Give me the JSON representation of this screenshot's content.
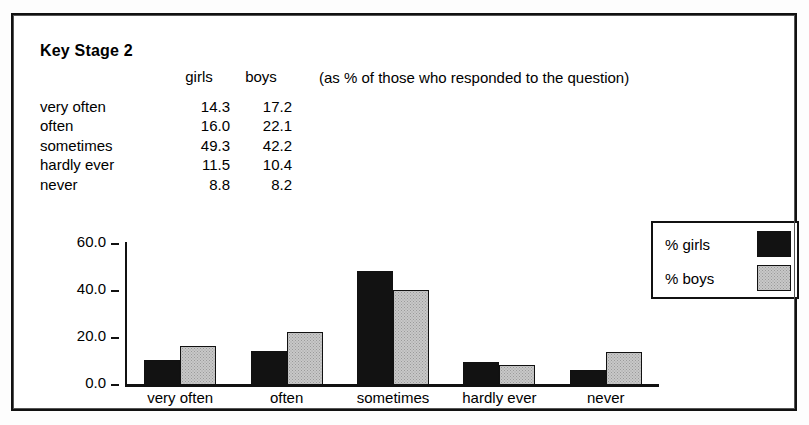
{
  "header": {
    "title": "Key Stage 2",
    "note": "(as % of those who responded to the question)"
  },
  "table": {
    "col_headers": [
      "girls",
      "boys"
    ],
    "rows": [
      {
        "label": "very often",
        "girls": "14.3",
        "boys": "17.2"
      },
      {
        "label": "often",
        "girls": "16.0",
        "boys": "22.1"
      },
      {
        "label": "sometimes",
        "girls": "49.3",
        "boys": "42.2"
      },
      {
        "label": "hardly ever",
        "girls": "11.5",
        "boys": "10.4"
      },
      {
        "label": "never",
        "girls": "8.8",
        "boys": "8.2"
      }
    ]
  },
  "legend": {
    "items": [
      {
        "label": "% girls",
        "color": "#121212"
      },
      {
        "label": "% boys",
        "color": "#c8c8c8"
      }
    ]
  },
  "chart_data": {
    "type": "bar",
    "title": "",
    "xlabel": "",
    "ylabel": "",
    "categories": [
      "very often",
      "often",
      "sometimes",
      "hardly ever",
      "never"
    ],
    "series": [
      {
        "name": "% girls",
        "color": "#121212",
        "values": [
          10.5,
          14.5,
          48.5,
          10.0,
          6.5
        ]
      },
      {
        "name": "% boys",
        "color": "#c8c8c8",
        "values": [
          16.5,
          22.5,
          40.5,
          8.5,
          14.0
        ]
      }
    ],
    "table_values": {
      "% girls": [
        14.3,
        16.0,
        49.3,
        11.5,
        8.8
      ],
      "% boys": [
        17.2,
        22.1,
        42.2,
        10.4,
        8.2
      ]
    },
    "ylim": [
      0,
      60
    ],
    "yticks": [
      "0.0",
      "20.0",
      "40.0",
      "60.0"
    ],
    "ytick_values": [
      0,
      20,
      40,
      60
    ],
    "grid": false,
    "legend_position": "right"
  }
}
